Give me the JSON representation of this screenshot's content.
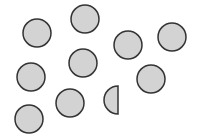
{
  "diagram": {
    "fill_color": "#d3d3d3",
    "stroke_color": "#333333",
    "stroke_width": 1.5,
    "radius": 14,
    "circles": [
      {
        "cx": 37,
        "cy": 33
      },
      {
        "cx": 85,
        "cy": 19
      },
      {
        "cx": 128,
        "cy": 45
      },
      {
        "cx": 172,
        "cy": 37
      },
      {
        "cx": 83,
        "cy": 63
      },
      {
        "cx": 31,
        "cy": 77
      },
      {
        "cx": 151,
        "cy": 79
      },
      {
        "cx": 70,
        "cy": 103
      },
      {
        "cx": 29,
        "cy": 119
      }
    ],
    "half_circles": [
      {
        "cx": 118,
        "cy": 100,
        "side": "left"
      }
    ],
    "counts": {
      "full_circles": 9,
      "half_circles": 1
    }
  }
}
